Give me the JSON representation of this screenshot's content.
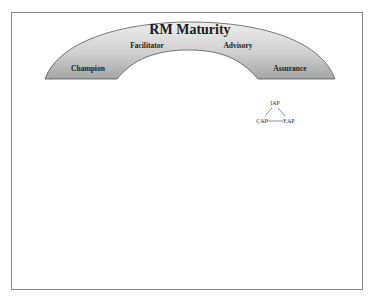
{
  "diagram": {
    "title": "RM Maturity",
    "stages": [
      {
        "label": "Champion"
      },
      {
        "label": "Facilitator"
      },
      {
        "label": "Advisory"
      },
      {
        "label": "Assurance"
      }
    ],
    "triangle": {
      "top": "IAP",
      "left": "CAP",
      "right": "EAP"
    },
    "colors": {
      "arch_top": "#e6e6e6",
      "arch_bottom": "#a9a9a9",
      "arch_stroke": "#555555",
      "frame": "#8a8a8a"
    }
  }
}
